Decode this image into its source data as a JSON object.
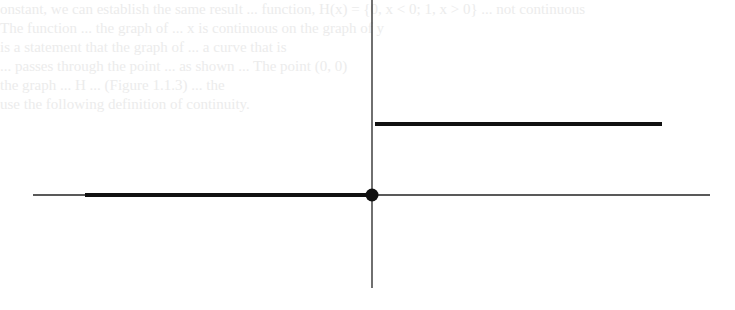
{
  "figure": {
    "type": "step-function-graph",
    "axes": {
      "x_axis": {
        "y": 195,
        "x_start": 33,
        "x_end": 710
      },
      "y_axis": {
        "x": 372,
        "y_start": 0,
        "y_end": 288
      }
    },
    "segments": [
      {
        "name": "lower-branch",
        "x1": 85,
        "x2": 372,
        "y": 195,
        "value": 0
      },
      {
        "name": "upper-branch",
        "x1": 375,
        "x2": 662,
        "y": 124,
        "value": 1
      }
    ],
    "point": {
      "name": "origin-closed-dot",
      "cx": 372,
      "cy": 195,
      "r": 6,
      "filled": true
    },
    "colors": {
      "stroke": "#111111",
      "axis": "#222222",
      "background": "#ffffff"
    }
  },
  "bleed_through_text": {
    "lines": [
      "onstant, we can establish the same result ... function, H(x) = {0, x < 0; 1, x > 0} ... not continuous",
      "   The function ... the graph of ... x is continuous on the graph of y",
      "   is a statement that the graph of ... a curve that is",
      "   ... passes through the point ... as shown ... The point (0, 0)",
      "   the graph ... H ... (Figure 1.1.3) ... the",
      "   use the following definition of continuity."
    ]
  }
}
